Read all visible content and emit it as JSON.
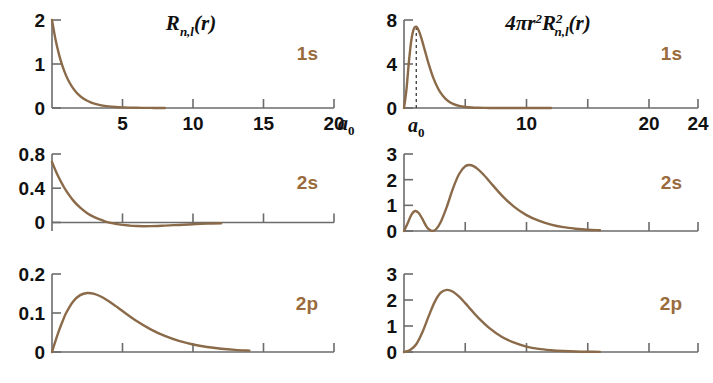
{
  "figure": {
    "title_left": "R_{n,l}(r)",
    "title_right": "4πr^2 R^2_{n,l}(r)",
    "curve_color": "#8a6a48",
    "label_color": "#9a6b3d",
    "axis_color": "#6b6b6b",
    "background": "#ffffff"
  },
  "titles": {
    "left": {
      "base": "R",
      "sub": "n,l",
      "tail": "(r)"
    },
    "right": {
      "prefix": "4",
      "pi": "π",
      "r": "r",
      "r_sup": "2",
      "R": "R",
      "R_sup": "2",
      "R_sub": "n,l",
      "tail": "(r)"
    }
  },
  "axis_unit": {
    "symbol": "a",
    "subscript": "0"
  },
  "chart_data": [
    {
      "id": "panel-1s-radial",
      "type": "line",
      "title": "R_{n,l}(r)",
      "orbital": "1s",
      "xlabel": "r / a0",
      "ylabel": "R_{n,l}(r)",
      "xlim": [
        0,
        20
      ],
      "ylim": [
        0,
        2
      ],
      "xticks": [
        5,
        10,
        15,
        20
      ],
      "xticklabels": [
        "5",
        "10",
        "15",
        "20"
      ],
      "yticks": [
        0,
        1,
        2
      ],
      "yticklabels": [
        "0",
        "1",
        "2"
      ],
      "grid": false,
      "x": [
        0.0,
        0.25,
        0.5,
        0.75,
        1.0,
        1.25,
        1.5,
        1.75,
        2.0,
        2.25,
        2.5,
        2.75,
        3.0,
        3.5,
        4.0,
        4.5,
        5.0,
        5.5,
        6.0,
        6.5,
        7.0,
        7.5,
        8.0
      ],
      "y": [
        2.0,
        1.557,
        1.213,
        0.944,
        0.736,
        0.573,
        0.446,
        0.347,
        0.271,
        0.211,
        0.164,
        0.128,
        0.0996,
        0.0604,
        0.0366,
        0.0222,
        0.0135,
        0.0082,
        0.005,
        0.003,
        0.0018,
        0.0011,
        0.0007
      ]
    },
    {
      "id": "panel-1s-prob",
      "type": "line",
      "title": "4πr^2 R^2_{n,l}(r)",
      "orbital": "1s",
      "xlabel": "r / a0",
      "ylabel": "4πr^2 R^2",
      "xlim": [
        0,
        24
      ],
      "ylim": [
        0,
        8
      ],
      "xticks": [
        5,
        10,
        15,
        20,
        24
      ],
      "xticklabels": [
        "",
        "10",
        "",
        "20",
        "24"
      ],
      "yticks": [
        0,
        4,
        8
      ],
      "yticklabels": [
        "0",
        "4",
        "8"
      ],
      "grid": false,
      "annotation": {
        "label": "a_0",
        "x": 1.0,
        "style": "dashed-vertical"
      },
      "x": [
        0.0,
        0.2,
        0.4,
        0.6,
        0.8,
        1.0,
        1.2,
        1.4,
        1.6,
        1.8,
        2.0,
        2.4,
        2.8,
        3.2,
        3.6,
        4.0,
        4.5,
        5.0,
        5.5,
        6.0,
        7.0,
        8.0,
        9.0,
        10.0,
        12.0
      ],
      "y": [
        0.0,
        1.67,
        4.2,
        6.17,
        7.19,
        7.39,
        7.05,
        6.42,
        5.64,
        4.84,
        4.06,
        2.71,
        1.73,
        1.07,
        0.64,
        0.38,
        0.19,
        0.091,
        0.042,
        0.019,
        0.0037,
        0.00067,
        0.00012,
        2e-05,
        0.0
      ]
    },
    {
      "id": "panel-2s-radial",
      "type": "line",
      "title": "R_{n,l}(r)",
      "orbital": "2s",
      "xlabel": "r / a0",
      "ylabel": "R_{n,l}(r)",
      "xlim": [
        0,
        20
      ],
      "ylim": [
        -0.1,
        0.8
      ],
      "xticks": [
        5,
        10,
        15,
        20
      ],
      "xticklabels": [
        "",
        "",
        "",
        ""
      ],
      "yticks": [
        0,
        0.4,
        0.8
      ],
      "yticklabels": [
        "0",
        "0.4",
        "0.8"
      ],
      "grid": false,
      "x": [
        0.0,
        0.25,
        0.5,
        0.75,
        1.0,
        1.5,
        2.0,
        2.5,
        3.0,
        3.5,
        4.0,
        4.5,
        5.0,
        5.5,
        6.0,
        6.5,
        7.0,
        7.5,
        8.0,
        9.0,
        10.0,
        11.0,
        12.0
      ],
      "y": [
        0.707,
        0.608,
        0.519,
        0.441,
        0.372,
        0.258,
        0.172,
        0.108,
        0.063,
        0.03,
        0.0,
        -0.015,
        -0.029,
        -0.037,
        -0.042,
        -0.044,
        -0.043,
        -0.041,
        -0.037,
        -0.029,
        -0.021,
        -0.014,
        -0.009
      ]
    },
    {
      "id": "panel-2s-prob",
      "type": "line",
      "title": "4πr^2 R^2_{n,l}(r)",
      "orbital": "2s",
      "xlabel": "r / a0",
      "ylabel": "4πr^2 R^2",
      "xlim": [
        0,
        24
      ],
      "ylim": [
        0,
        3
      ],
      "xticks": [
        5,
        10,
        15,
        20,
        24
      ],
      "xticklabels": [
        "",
        "",
        "",
        "",
        ""
      ],
      "yticks": [
        0,
        1,
        2,
        3
      ],
      "yticklabels": [
        "0",
        "1",
        "2",
        "3"
      ],
      "grid": false,
      "x": [
        0.0,
        0.3,
        0.6,
        0.9,
        1.2,
        1.5,
        1.8,
        2.0,
        2.3,
        2.6,
        3.0,
        3.5,
        4.0,
        4.5,
        5.0,
        5.5,
        6.0,
        6.5,
        7.0,
        8.0,
        9.0,
        10.0,
        11.0,
        12.0,
        13.0,
        14.0,
        15.0,
        16.0
      ],
      "y": [
        0.0,
        0.3,
        0.63,
        0.78,
        0.7,
        0.47,
        0.2,
        0.08,
        0.005,
        0.06,
        0.35,
        0.95,
        1.66,
        2.22,
        2.52,
        2.56,
        2.42,
        2.19,
        1.92,
        1.38,
        0.94,
        0.62,
        0.4,
        0.25,
        0.15,
        0.09,
        0.05,
        0.03
      ]
    },
    {
      "id": "panel-2p-radial",
      "type": "line",
      "title": "R_{n,l}(r)",
      "orbital": "2p",
      "xlabel": "r / a0",
      "ylabel": "R_{n,l}(r)",
      "xlim": [
        0,
        20
      ],
      "ylim": [
        0,
        0.2
      ],
      "xticks": [
        5,
        10,
        15,
        20
      ],
      "xticklabels": [
        "",
        "",
        "",
        ""
      ],
      "yticks": [
        0,
        0.1,
        0.2
      ],
      "yticklabels": [
        "0",
        "0.1",
        "0.2"
      ],
      "grid": false,
      "x": [
        0.0,
        0.25,
        0.5,
        0.75,
        1.0,
        1.5,
        2.0,
        2.5,
        3.0,
        3.5,
        4.0,
        4.5,
        5.0,
        6.0,
        7.0,
        8.0,
        9.0,
        10.0,
        11.0,
        12.0,
        13.0,
        14.0
      ],
      "y": [
        0.0,
        0.0285,
        0.0552,
        0.0788,
        0.1,
        0.1297,
        0.1458,
        0.1513,
        0.1491,
        0.1417,
        0.131,
        0.1183,
        0.1051,
        0.0795,
        0.0581,
        0.0411,
        0.0284,
        0.0193,
        0.0129,
        0.0085,
        0.0055,
        0.0035
      ]
    },
    {
      "id": "panel-2p-prob",
      "type": "line",
      "title": "4πr^2 R^2_{n,l}(r)",
      "orbital": "2p",
      "xlabel": "r / a0",
      "ylabel": "4πr^2 R^2",
      "xlim": [
        0,
        24
      ],
      "ylim": [
        0,
        3
      ],
      "xticks": [
        5,
        10,
        15,
        20,
        24
      ],
      "xticklabels": [
        "",
        "",
        "",
        "",
        ""
      ],
      "yticks": [
        0,
        1,
        2,
        3
      ],
      "yticklabels": [
        "0",
        "1",
        "2",
        "3"
      ],
      "grid": false,
      "x": [
        0.0,
        0.5,
        1.0,
        1.5,
        2.0,
        2.5,
        3.0,
        3.5,
        4.0,
        4.5,
        5.0,
        5.5,
        6.0,
        7.0,
        8.0,
        9.0,
        10.0,
        11.0,
        12.0,
        13.0,
        14.0,
        15.0,
        16.0
      ],
      "y": [
        0.0,
        0.08,
        0.3,
        0.76,
        1.36,
        1.92,
        2.28,
        2.39,
        2.32,
        2.13,
        1.88,
        1.61,
        1.35,
        0.91,
        0.58,
        0.36,
        0.21,
        0.12,
        0.07,
        0.04,
        0.021,
        0.011,
        0.006
      ]
    }
  ],
  "panel_labels": [
    "1s",
    "1s",
    "2s",
    "2s",
    "2p",
    "2p"
  ]
}
